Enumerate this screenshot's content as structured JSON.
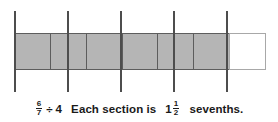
{
  "figure": {
    "type": "fraction-bar-model",
    "bar": {
      "total_cells": 7,
      "shaded_cells": 6,
      "empty_cells": 1,
      "cells": [
        {
          "index": 1,
          "state": "shaded"
        },
        {
          "index": 2,
          "state": "shaded"
        },
        {
          "index": 3,
          "state": "shaded"
        },
        {
          "index": 4,
          "state": "shaded"
        },
        {
          "index": 5,
          "state": "shaded"
        },
        {
          "index": 6,
          "state": "shaded"
        },
        {
          "index": 7,
          "state": "empty"
        }
      ],
      "shaded_color": "#b5b5b5",
      "empty_color": "#ffffff",
      "border_color": "#5d5d5d"
    },
    "division_lines": {
      "count": 5,
      "color": "#4d4d4d",
      "x_positions": [
        14,
        67,
        120,
        173,
        226
      ]
    }
  },
  "caption": {
    "expression": {
      "dividend_numerator": "6",
      "dividend_denominator": "7",
      "operator": "÷",
      "divisor": "4"
    },
    "sentence_before": "Each section is",
    "result": {
      "whole": "1",
      "numerator": "1",
      "denominator": "2"
    },
    "sentence_after": "sevenths."
  }
}
